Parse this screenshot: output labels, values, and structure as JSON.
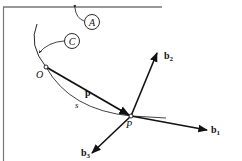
{
  "diagram": {
    "labels": {
      "circle_a": "A",
      "circle_c": "C",
      "origin": "O",
      "point": "P",
      "position_vector": "p",
      "arc_length": "s",
      "b1": "b",
      "b1_sub": "1",
      "b2": "b",
      "b2_sub": "2",
      "b3": "b",
      "b3_sub": "3"
    },
    "colors": {
      "stroke": "#111111",
      "frame": "#555555",
      "background": "#ffffff"
    }
  }
}
